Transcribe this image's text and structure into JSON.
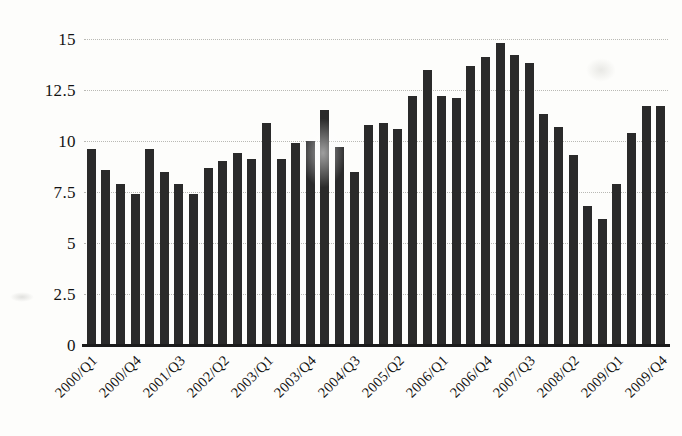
{
  "chart_data": {
    "type": "bar",
    "title": "",
    "subtitle": "",
    "xlabel": "",
    "ylabel": "",
    "grid": true,
    "legend": null,
    "ylim": [
      0,
      15
    ],
    "yticks": [
      "0",
      "2.5",
      "5",
      "7.5",
      "10",
      "12.5",
      "15"
    ],
    "ytick_values": [
      0,
      2.5,
      5,
      7.5,
      10,
      12.5,
      15
    ],
    "categories": [
      "2000/Q1",
      "2000/Q2",
      "2000/Q3",
      "2000/Q4",
      "2001/Q1",
      "2001/Q2",
      "2001/Q3",
      "2001/Q4",
      "2002/Q1",
      "2002/Q2",
      "2002/Q3",
      "2002/Q4",
      "2003/Q1",
      "2003/Q2",
      "2003/Q3",
      "2003/Q4",
      "2004/Q1",
      "2004/Q2",
      "2004/Q3",
      "2004/Q4",
      "2005/Q1",
      "2005/Q2",
      "2005/Q3",
      "2005/Q4",
      "2006/Q1",
      "2006/Q2",
      "2006/Q3",
      "2006/Q4",
      "2007/Q1",
      "2007/Q2",
      "2007/Q3",
      "2007/Q4",
      "2008/Q1",
      "2008/Q2",
      "2008/Q3",
      "2008/Q4",
      "2009/Q1",
      "2009/Q2",
      "2009/Q3",
      "2009/Q4"
    ],
    "values": [
      9.6,
      8.6,
      7.9,
      7.4,
      9.6,
      8.5,
      7.9,
      7.4,
      8.7,
      9.0,
      9.4,
      9.1,
      10.9,
      9.1,
      9.9,
      10.0,
      11.5,
      9.7,
      8.5,
      10.8,
      10.9,
      10.6,
      12.2,
      13.5,
      12.2,
      12.1,
      13.7,
      14.1,
      14.8,
      14.2,
      13.8,
      11.3,
      10.7,
      9.3,
      6.8,
      6.2,
      7.9,
      10.4,
      11.7,
      11.7
    ],
    "xtick_labels_shown": [
      "2000/Q1",
      "2000/Q4",
      "2001/Q3",
      "2002/Q2",
      "2003/Q1",
      "2003/Q4",
      "2004/Q3",
      "2005/Q2",
      "2006/Q1",
      "2006/Q4",
      "2007/Q3",
      "2008/Q2",
      "2009/Q1",
      "2009/Q4"
    ],
    "xtick_label_indices": [
      0,
      3,
      6,
      9,
      12,
      15,
      18,
      21,
      24,
      27,
      30,
      33,
      36,
      39
    ],
    "bar_color": "#2a2a2a",
    "grid_color": "#b9b9b4",
    "axis_color": "#1b1b1b",
    "background_color": "#fdfdfb"
  }
}
